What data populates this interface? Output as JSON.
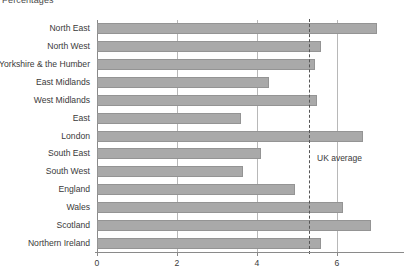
{
  "chart_data": {
    "type": "bar",
    "orientation": "horizontal",
    "title": "Percentages",
    "xlabel": "",
    "ylabel": "",
    "xlim": [
      0,
      7.75
    ],
    "xticks": [
      0,
      2,
      4,
      6
    ],
    "xtick_labels": [
      "0",
      "2",
      "4",
      "6"
    ],
    "grid": "vertical",
    "legend": "none",
    "categories": [
      "North East",
      "North West",
      "Yorkshire & the Humber",
      "East Midlands",
      "West Midlands",
      "East",
      "London",
      "South East",
      "South West",
      "England",
      "Wales",
      "Scotland",
      "Northern Ireland"
    ],
    "values": [
      7.0,
      5.6,
      5.45,
      4.3,
      5.5,
      3.6,
      6.65,
      4.1,
      3.65,
      4.95,
      6.15,
      6.85,
      5.6
    ],
    "annotations": [
      {
        "type": "reference-line",
        "label": "UK average",
        "value": 5.3,
        "style": "dashed"
      }
    ],
    "bar_color": "#a9a9a9",
    "axis_color": "#8a8a8a",
    "grid_color": "#b8b8b8",
    "reference_line_color": "#555555"
  }
}
